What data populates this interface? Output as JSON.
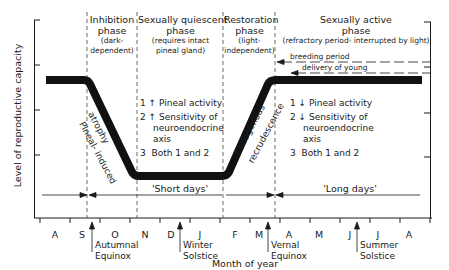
{
  "axis": {
    "ylabel": "Level of reproductive capacity",
    "xlabel": "Month of year",
    "months": [
      "A",
      "S",
      "O",
      "N",
      "D",
      "J",
      "F",
      "M",
      "A",
      "M",
      "J",
      "J",
      "A"
    ]
  },
  "phases": [
    {
      "title_1": "Inhibition",
      "title_2": "phase",
      "note_1": "(dark-",
      "note_2": "dependent)"
    },
    {
      "title_1": "Sexually quiescent",
      "title_2": "phase",
      "note_1": "(requires intact",
      "note_2": "pineal gland)"
    },
    {
      "title_1": "Restoration",
      "title_2": "phase",
      "note_1": "(light-",
      "note_2": "independent)"
    },
    {
      "title_1": "Sexually active",
      "title_2": "phase",
      "note_1": "(refractory period- interrupted by light)"
    }
  ],
  "curve_labels": {
    "decline_1": "Pineal- induced",
    "decline_2": "atrophy",
    "rise_1": "Endogenous",
    "rise_2": "recrudescence"
  },
  "quiescent_list": [
    {
      "num": "1",
      "arrow": "↑",
      "text": "Pineal activity"
    },
    {
      "num": "2",
      "arrow": "↑",
      "text": "Sensitivity of"
    },
    {
      "num": "",
      "arrow": "",
      "text": "neuroendocrine"
    },
    {
      "num": "",
      "arrow": "",
      "text": "axis"
    },
    {
      "num": "3",
      "arrow": "",
      "text": "Both 1 and 2"
    }
  ],
  "active_list": [
    {
      "num": "1",
      "arrow": "↓",
      "text": "Pineal activity"
    },
    {
      "num": "2",
      "arrow": "↓",
      "text": "Sensitivity of"
    },
    {
      "num": "",
      "arrow": "",
      "text": "neuroendocrine"
    },
    {
      "num": "",
      "arrow": "",
      "text": "axis"
    },
    {
      "num": "3",
      "arrow": "",
      "text": "Both 1 and 2"
    }
  ],
  "periods": {
    "breeding": "breeding period",
    "delivery": "delivery of young",
    "short_days": "'Short days'",
    "long_days": "'Long days'"
  },
  "events": {
    "autumnal_1": "Autumnal",
    "autumnal_2": "Equinox",
    "winter_1": "Winter",
    "winter_2": "Solstice",
    "vernal_1": "Vernal",
    "vernal_2": "Equinox",
    "summer_1": "Summer",
    "summer_2": "Solstice"
  },
  "colors": {
    "ink": "#1a1a1a",
    "background": "#ffffff"
  }
}
